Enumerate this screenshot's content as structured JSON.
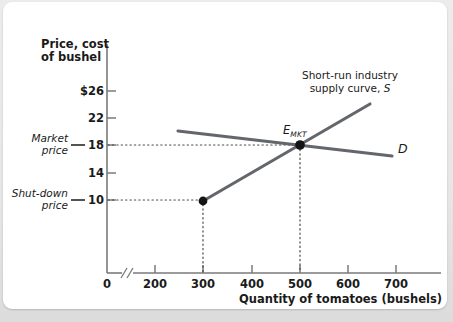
{
  "figure": {
    "background_color": "#ffffff",
    "surround_color": "#e9e9e9",
    "axis_color": "#7a7a7a",
    "curve_color": "#63666b",
    "text_color": "#1a1a1a"
  },
  "axes": {
    "y_title_line1": "Price, cost",
    "y_title_line2": "of bushel",
    "x_title": "Quantity of tomatoes (bushels)",
    "origin_label": "0",
    "axis_break_glyph": "//"
  },
  "annotations": {
    "market_price_line1": "Market",
    "market_price_line2": "price",
    "shutdown_price_line1": "Shut-down",
    "shutdown_price_line2": "price",
    "supply_note_line1": "Short-run industry",
    "supply_note_line2": "supply curve, S",
    "equilibrium_label": "E",
    "equilibrium_sub": "MKT",
    "demand_label": "D"
  },
  "chart_data": {
    "type": "line",
    "title": "",
    "xlabel": "Quantity of tomatoes (bushels)",
    "ylabel": "Price, cost of bushel",
    "xlim": [
      150,
      760
    ],
    "ylim": [
      0,
      28
    ],
    "x_ticks": [
      200,
      300,
      400,
      500,
      600,
      700
    ],
    "x_tick_labels": [
      "200",
      "300",
      "400",
      "500",
      "600",
      "700"
    ],
    "y_ticks": [
      10,
      14,
      18,
      22,
      26
    ],
    "y_tick_labels": [
      "10",
      "14",
      "18",
      "22",
      "$26"
    ],
    "grid": false,
    "legend": "none",
    "axis_break_after_zero": true,
    "series": [
      {
        "name": "Short-run industry supply curve, S",
        "label": "S",
        "type": "line",
        "x": [
          300,
          700
        ],
        "y": [
          10,
          25
        ],
        "color": "#63666b"
      },
      {
        "name": "Demand curve, D",
        "label": "D",
        "type": "line",
        "x": [
          250,
          710
        ],
        "y": [
          20,
          16.6
        ],
        "color": "#63666b"
      }
    ],
    "points": [
      {
        "name": "shut-down-point",
        "label": "",
        "x": 300,
        "y": 10,
        "color": "#111111"
      },
      {
        "name": "market-equilibrium",
        "label": "E_MKT",
        "x": 500,
        "y": 18,
        "color": "#111111"
      }
    ],
    "reference_lines": [
      {
        "name": "market-price-horizontal",
        "orientation": "horizontal",
        "value": 18,
        "style": "dotted",
        "from_x": 150,
        "to_x": 500
      },
      {
        "name": "shutdown-price-horizontal",
        "orientation": "horizontal",
        "value": 10,
        "style": "dotted",
        "from_x": 150,
        "to_x": 300
      },
      {
        "name": "equilibrium-quantity-vertical",
        "orientation": "vertical",
        "value": 500,
        "style": "dotted",
        "from_y": 0,
        "to_y": 18
      },
      {
        "name": "shutdown-quantity-vertical",
        "orientation": "vertical",
        "value": 300,
        "style": "dotted",
        "from_y": 0,
        "to_y": 10
      }
    ],
    "callouts": [
      {
        "name": "market-price",
        "text": "Market price",
        "y": 18
      },
      {
        "name": "shut-down-price",
        "text": "Shut-down price",
        "y": 10
      }
    ]
  }
}
